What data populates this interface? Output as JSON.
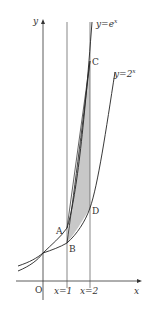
{
  "diagram": {
    "axes": {
      "x_label": "x",
      "y_label": "y",
      "origin_label": "O"
    },
    "curves": [
      {
        "name": "exp-e",
        "label": "y=e^x",
        "base": "e",
        "exp": "x",
        "label_base": "y=e",
        "label_sup": "x"
      },
      {
        "name": "exp-2",
        "label": "y=2^x",
        "base": "2",
        "exp": "x",
        "label_base": "y=2",
        "label_sup": "x"
      }
    ],
    "vertical_lines": [
      {
        "label": "x=1"
      },
      {
        "label": "x=2"
      }
    ],
    "points": [
      {
        "label": "A"
      },
      {
        "label": "B"
      },
      {
        "label": "C"
      },
      {
        "label": "D"
      }
    ],
    "shaded_region_color": "#c8c8c8",
    "line_color": "#333333"
  }
}
